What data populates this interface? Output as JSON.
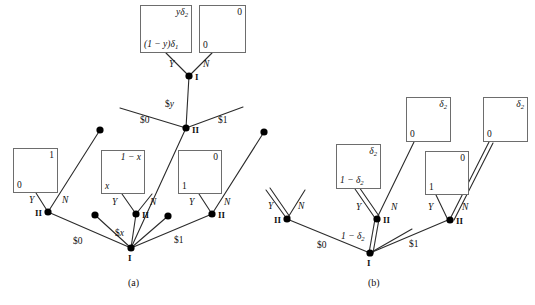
{
  "figure": {
    "captions": [
      {
        "id": "cap-a",
        "text": "(a)",
        "x": 128,
        "y": 277
      },
      {
        "id": "cap-b",
        "text": "(b)",
        "x": 368,
        "y": 277
      }
    ]
  },
  "panel_a": {
    "boxes": [
      {
        "id": "a-box-top-left",
        "x": 140,
        "y": 5,
        "w": 52,
        "h": 48,
        "top_right": "yδ₂",
        "bottom_left": "(1 − y)δ₁"
      },
      {
        "id": "a-box-top-right",
        "x": 199,
        "y": 5,
        "w": 47,
        "h": 48,
        "top_right": "0",
        "bottom_left": "0"
      },
      {
        "id": "a-box-left",
        "x": 13,
        "y": 148,
        "w": 45,
        "h": 45,
        "top_right": "1",
        "bottom_left": "0"
      },
      {
        "id": "a-box-mid",
        "x": 101,
        "y": 150,
        "w": 44,
        "h": 44,
        "top_right": "1 − x",
        "bottom_left": "x"
      },
      {
        "id": "a-box-right",
        "x": 178,
        "y": 150,
        "w": 44,
        "h": 44,
        "top_right": "0",
        "bottom_left": "1"
      }
    ],
    "nodes": [
      {
        "id": "a-node-I-top",
        "label": "I",
        "x": 189,
        "y": 76
      },
      {
        "id": "a-node-II-mid",
        "label": "II",
        "x": 186,
        "y": 128
      },
      {
        "id": "a-node-II-left",
        "label": "II",
        "x": 48,
        "y": 212
      },
      {
        "id": "a-node-II-center",
        "label": "II",
        "x": 136,
        "y": 214
      },
      {
        "id": "a-node-II-right",
        "label": "II",
        "x": 212,
        "y": 214
      },
      {
        "id": "a-node-I-bottom",
        "label": "I",
        "x": 131,
        "y": 248
      },
      {
        "id": "a-stub-dot-1",
        "label": "",
        "x": 100,
        "y": 130
      },
      {
        "id": "a-stub-dot-2",
        "label": "",
        "x": 264,
        "y": 132
      },
      {
        "id": "a-stub-dot-3",
        "label": "",
        "x": 95,
        "y": 215
      },
      {
        "id": "a-stub-dot-4",
        "label": "",
        "x": 168,
        "y": 216
      }
    ],
    "edge_labels": [
      {
        "id": "a-lbl-Y-top",
        "text": "Y",
        "x": 169,
        "y": 60,
        "italic": true
      },
      {
        "id": "a-lbl-N-top",
        "text": "N",
        "x": 203,
        "y": 60,
        "italic": true
      },
      {
        "id": "a-lbl-money-y",
        "text": "$y",
        "x": 165,
        "y": 100,
        "italic": false
      },
      {
        "id": "a-lbl-money-0-mid",
        "text": "$0",
        "x": 140,
        "y": 116,
        "italic": false
      },
      {
        "id": "a-lbl-money-1-mid",
        "text": "$1",
        "x": 218,
        "y": 116,
        "italic": false
      },
      {
        "id": "a-lbl-Y-left",
        "text": "Y",
        "x": 29,
        "y": 196,
        "italic": true
      },
      {
        "id": "a-lbl-N-left",
        "text": "N",
        "x": 62,
        "y": 196,
        "italic": true
      },
      {
        "id": "a-lbl-Y-center",
        "text": "Y",
        "x": 112,
        "y": 198,
        "italic": true
      },
      {
        "id": "a-lbl-N-center",
        "text": "N",
        "x": 150,
        "y": 198,
        "italic": true
      },
      {
        "id": "a-lbl-Y-right",
        "text": "Y",
        "x": 189,
        "y": 198,
        "italic": true
      },
      {
        "id": "a-lbl-N-right",
        "text": "N",
        "x": 224,
        "y": 198,
        "italic": true
      },
      {
        "id": "a-lbl-money-0-bot",
        "text": "$0",
        "x": 73,
        "y": 237,
        "italic": false
      },
      {
        "id": "a-lbl-money-x-bot",
        "text": "$x",
        "x": 115,
        "y": 229,
        "italic": false
      },
      {
        "id": "a-lbl-money-1-bot",
        "text": "$1",
        "x": 174,
        "y": 236,
        "italic": false
      }
    ]
  },
  "panel_b": {
    "boxes": [
      {
        "id": "b-box-left",
        "x": 336,
        "y": 144,
        "w": 45,
        "h": 45,
        "top_right": "δ₂",
        "bottom_left": "1 − δ₂"
      },
      {
        "id": "b-box-mid-top",
        "x": 406,
        "y": 97,
        "w": 45,
        "h": 45,
        "top_right": "δ₂",
        "bottom_left": "0"
      },
      {
        "id": "b-box-right-top",
        "x": 483,
        "y": 97,
        "w": 45,
        "h": 45,
        "top_right": "δ₂",
        "bottom_left": "0"
      },
      {
        "id": "b-box-right",
        "x": 425,
        "y": 151,
        "w": 44,
        "h": 44,
        "top_right": "0",
        "bottom_left": "1"
      }
    ],
    "nodes": [
      {
        "id": "b-node-II-left",
        "label": "II",
        "x": 287,
        "y": 219
      },
      {
        "id": "b-node-II-center",
        "label": "II",
        "x": 376,
        "y": 219
      },
      {
        "id": "b-node-II-right",
        "label": "II",
        "x": 448,
        "y": 220
      },
      {
        "id": "b-node-I-bottom",
        "label": "I",
        "x": 370,
        "y": 253
      }
    ],
    "edge_labels": [
      {
        "id": "b-lbl-Y-left",
        "text": "Y",
        "x": 268,
        "y": 202,
        "italic": true
      },
      {
        "id": "b-lbl-N-left",
        "text": "N",
        "x": 298,
        "y": 202,
        "italic": true
      },
      {
        "id": "b-lbl-Y-center",
        "text": "Y",
        "x": 356,
        "y": 203,
        "italic": true
      },
      {
        "id": "b-lbl-N-center",
        "text": "N",
        "x": 391,
        "y": 203,
        "italic": true
      },
      {
        "id": "b-lbl-Y-right",
        "text": "Y",
        "x": 428,
        "y": 203,
        "italic": true
      },
      {
        "id": "b-lbl-N-right",
        "text": "N",
        "x": 462,
        "y": 203,
        "italic": true
      },
      {
        "id": "b-lbl-money-0",
        "text": "$0",
        "x": 317,
        "y": 241,
        "italic": false
      },
      {
        "id": "b-lbl-delta",
        "text": "1 − δ₂",
        "x": 345,
        "y": 233,
        "italic": true
      },
      {
        "id": "b-lbl-money-1",
        "text": "$1",
        "x": 409,
        "y": 240,
        "italic": false
      }
    ]
  },
  "style": {
    "line_color": "#2b2b2b",
    "node_color": "#000000",
    "box_border": "#6d6d6d",
    "background": "#ffffff"
  }
}
